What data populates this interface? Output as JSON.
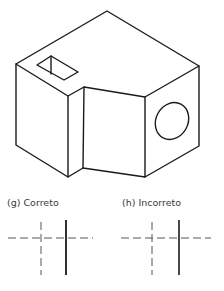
{
  "figure": {
    "line_color": "#1a1a1a",
    "dash_color": "#555555"
  },
  "panels": [
    {
      "id": "g",
      "label": "(g) Correto",
      "verdict": "correct"
    },
    {
      "id": "h",
      "label": "(h) Incorreto",
      "verdict": "incorrect"
    }
  ]
}
